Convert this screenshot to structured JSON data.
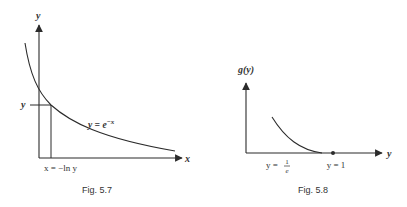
{
  "figures": [
    {
      "caption": "Fig. 5.7",
      "y_axis_label": "y",
      "x_axis_label": "x",
      "curve_label_base": "y = e",
      "curve_label_exp": "−x",
      "marker_y_label": "y",
      "marker_x_label": "x = −ln y"
    },
    {
      "caption": "Fig. 5.8",
      "y_axis_label": "g(y)",
      "x_axis_label": "y",
      "tick_left_prefix": "y =",
      "tick_left_num": "1",
      "tick_left_den": "e",
      "tick_right_label": "y = 1"
    }
  ],
  "colors": {
    "line": "#2b2b2b",
    "text": "#333333"
  }
}
